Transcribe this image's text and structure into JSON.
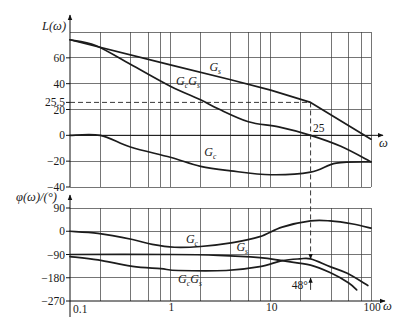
{
  "chart_data": [
    {
      "type": "line",
      "title": "",
      "xlabel": "ω",
      "ylabel": "L(ω)",
      "xscale": "log",
      "xlim": [
        0.1,
        100
      ],
      "ylim": [
        -40,
        80
      ],
      "grid": true,
      "legend_position": "none",
      "x_axis_at": 0,
      "xgrid": [
        0.2,
        0.4,
        0.6,
        0.8,
        1,
        2,
        4,
        6,
        8,
        10,
        20,
        40,
        60,
        80,
        100
      ],
      "ygrid": [
        80,
        60,
        40,
        20,
        0,
        -20,
        -40
      ],
      "yticks": [
        60,
        40,
        25.5,
        20,
        0,
        -20,
        -40
      ],
      "yticklabels": [
        "60",
        "40",
        "25.5",
        "20",
        "0",
        "−20",
        "−40"
      ],
      "xticks": [],
      "xticklabels": [],
      "series": [
        {
          "name": "Gs",
          "label": [
            {
              "t": "G",
              "sub": "s"
            }
          ],
          "label_at": [
            2.8,
            53
          ],
          "smooth": false,
          "x": [
            0.1,
            1,
            4,
            10,
            25,
            100
          ],
          "y": [
            74,
            54.5,
            43,
            35,
            25.5,
            -3
          ]
        },
        {
          "name": "GcGs",
          "label": [
            {
              "t": "G",
              "sub": "c"
            },
            {
              "t": "G",
              "sub": "s"
            }
          ],
          "label_at": [
            1.5,
            42
          ],
          "smooth": true,
          "x": [
            0.1,
            0.18,
            0.4,
            1,
            2,
            3,
            6,
            12,
            25,
            50,
            100
          ],
          "y": [
            74,
            69.5,
            55,
            38,
            27.5,
            20.5,
            10.5,
            6.5,
            0,
            -8.5,
            -20.5
          ]
        },
        {
          "name": "Gc",
          "label": [
            {
              "t": "G",
              "sub": "c"
            }
          ],
          "label_at": [
            2.5,
            -13
          ],
          "smooth": true,
          "x": [
            0.1,
            0.2,
            0.4,
            1,
            2,
            4,
            10,
            25,
            45,
            100
          ],
          "y": [
            0,
            0,
            -9,
            -17,
            -24,
            -27.5,
            -30.5,
            -28.5,
            -21.5,
            -20.5
          ]
        }
      ],
      "annotations": [
        {
          "type": "hline_dashed",
          "y": 25.5,
          "x_from": 0.1,
          "x_to": 25
        },
        {
          "type": "text",
          "text": "25",
          "x": 26.4,
          "y": 5.6,
          "anchor": "start"
        },
        {
          "type": "vline_dashed_arrow",
          "x": 25,
          "from_y": 25.5,
          "to_panel": 1,
          "to_y": -107
        }
      ]
    },
    {
      "type": "line",
      "title": "",
      "xlabel": "ω",
      "ylabel": "φ(ω)/(°)",
      "xscale": "log",
      "xlim": [
        0.1,
        100
      ],
      "ylim": [
        -270,
        90
      ],
      "grid": true,
      "legend_position": "none",
      "x_axis_at": -270,
      "xgrid": [
        0.2,
        0.4,
        0.6,
        0.8,
        1,
        2,
        4,
        6,
        8,
        10,
        20,
        40,
        60,
        80,
        100
      ],
      "ygrid": [
        90,
        0,
        -90,
        -180
      ],
      "yticks": [
        90,
        0,
        -90,
        -180,
        -270
      ],
      "yticklabels": [
        "90",
        "0",
        "−90",
        "−180",
        "−270"
      ],
      "xticks": [
        0.1,
        1,
        10,
        100
      ],
      "xticklabels": [
        "0.1",
        "1",
        "10",
        "100"
      ],
      "series": [
        {
          "name": "Gc",
          "label": [
            {
              "t": "G",
              "sub": "c"
            }
          ],
          "label_at": [
            1.64,
            -30
          ],
          "smooth": true,
          "x": [
            0.1,
            0.19,
            0.42,
            0.66,
            1.1,
            2,
            4.2,
            7.8,
            13,
            25,
            39,
            66,
            100
          ],
          "y": [
            0,
            -8,
            -32,
            -51,
            -62,
            -59,
            -44,
            -21,
            16,
            40,
            40,
            28,
            12
          ]
        },
        {
          "name": "Gs",
          "label": [
            {
              "t": "G",
              "sub": "s"
            }
          ],
          "label_at": [
            5.2,
            -61
          ],
          "smooth": true,
          "x": [
            0.1,
            1,
            3,
            7.8,
            13,
            25,
            40,
            60,
            72
          ],
          "y": [
            -90,
            -90,
            -93,
            -102,
            -114,
            -131,
            -162,
            -200,
            -227
          ]
        },
        {
          "name": "GcGs",
          "label": [
            {
              "t": "G",
              "sub": "c"
            },
            {
              "t": "G",
              "sub": "s"
            }
          ],
          "label_at": [
            1.57,
            -185
          ],
          "smooth": true,
          "x": [
            0.1,
            0.19,
            0.42,
            0.8,
            1.2,
            3.6,
            7.8,
            13,
            19.5,
            25,
            39,
            58,
            93
          ],
          "y": [
            -98,
            -111,
            -136,
            -145,
            -152,
            -152,
            -137,
            -114,
            -107,
            -107,
            -137,
            -163,
            -210
          ]
        }
      ],
      "annotations": [
        {
          "type": "text",
          "text": "48°",
          "x": 23.5,
          "y": -209,
          "anchor": "end"
        },
        {
          "type": "arrow",
          "x": 25,
          "y_from": -227,
          "y_to": -181
        }
      ]
    }
  ]
}
